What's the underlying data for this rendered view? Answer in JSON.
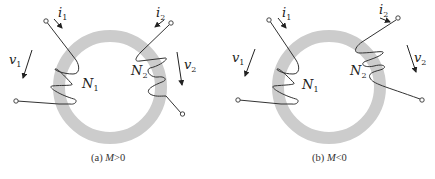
{
  "colors": {
    "core": "#cccccc",
    "wire": "#333333",
    "background": "#ffffff"
  },
  "diagrams": [
    {
      "id": "a",
      "caption_prefix": "(a) ",
      "caption_var": "M",
      "caption_rel": ">0",
      "labels": {
        "i1": "i",
        "i1_sub": "1",
        "i2": "i",
        "i2_sub": "2",
        "v1": "v",
        "v1_sub": "1",
        "v2": "v",
        "v2_sub": "2",
        "N1": "N",
        "N1_sub": "1",
        "N2": "N",
        "N2_sub": "2"
      }
    },
    {
      "id": "b",
      "caption_prefix": "(b) ",
      "caption_var": "M",
      "caption_rel": "<0",
      "labels": {
        "i1": "i",
        "i1_sub": "1",
        "i2": "i",
        "i2_sub": "2",
        "v1": "v",
        "v1_sub": "1",
        "v2": "v",
        "v2_sub": "2",
        "N1": "N",
        "N1_sub": "1",
        "N2": "N",
        "N2_sub": "2"
      }
    }
  ]
}
